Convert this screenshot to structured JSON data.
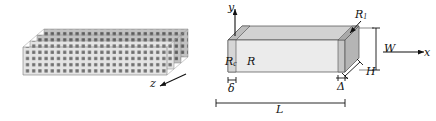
{
  "figure": {
    "type": "technical-schematic",
    "background_color": "#ffffff",
    "ink_color": "#111111"
  },
  "left_panel": {
    "name": "layered-dot-array-stack",
    "layer_count": 4,
    "layer_fill": "#e2e2e2",
    "dot_color": "#6f6f6f",
    "dot_columns": 30,
    "dot_rows": 7,
    "axis": {
      "label": "z",
      "direction": "down-left"
    }
  },
  "right_panel": {
    "name": "rectangular-bar-geometry",
    "faces": {
      "front_fill": "#e9e9e9",
      "top_fill": "#d0d0d0",
      "end_fill": "#b9b9b9",
      "contact_fill": "#c9c9c9"
    },
    "axes": [
      {
        "label": "y",
        "direction": "up"
      },
      {
        "label": "x",
        "direction": "right"
      }
    ],
    "region_labels": [
      {
        "key": "Rc",
        "text": "R",
        "sub": "c",
        "meaning": "contact-region-resistance"
      },
      {
        "key": "R",
        "text": "R",
        "sub": "",
        "meaning": "bulk-region-resistance"
      },
      {
        "key": "R1",
        "text": "R",
        "sub": "1",
        "meaning": "end-region-resistance"
      }
    ],
    "dimensions": [
      {
        "key": "W",
        "text": "W",
        "sub": "",
        "meaning": "width",
        "orientation": "vertical"
      },
      {
        "key": "H",
        "text": "H",
        "sub": "",
        "meaning": "height",
        "orientation": "depth"
      },
      {
        "key": "L",
        "text": "L",
        "sub": "",
        "meaning": "length",
        "orientation": "horizontal"
      },
      {
        "key": "delta",
        "text": "δ",
        "sub": "",
        "meaning": "contact-layer-thickness",
        "orientation": "horizontal"
      },
      {
        "key": "Delta",
        "text": "Δ",
        "sub": "",
        "meaning": "end-layer-thickness",
        "orientation": "horizontal"
      }
    ]
  }
}
